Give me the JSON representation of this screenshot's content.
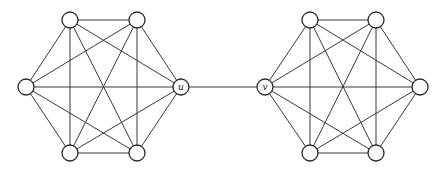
{
  "diagram": {
    "type": "graph",
    "node_radius": 8,
    "nodes": [
      {
        "id": "a1",
        "label": "",
        "x": 70,
        "y": 20
      },
      {
        "id": "a2",
        "label": "",
        "x": 137,
        "y": 20
      },
      {
        "id": "a3",
        "label": "",
        "x": 26,
        "y": 87
      },
      {
        "id": "u",
        "label": "u",
        "x": 181,
        "y": 87
      },
      {
        "id": "a5",
        "label": "",
        "x": 70,
        "y": 153
      },
      {
        "id": "a6",
        "label": "",
        "x": 137,
        "y": 153
      },
      {
        "id": "b1",
        "label": "",
        "x": 310,
        "y": 20
      },
      {
        "id": "b2",
        "label": "",
        "x": 376,
        "y": 20
      },
      {
        "id": "v",
        "label": "v",
        "x": 265,
        "y": 87
      },
      {
        "id": "b4",
        "label": "",
        "x": 420,
        "y": 87
      },
      {
        "id": "b5",
        "label": "",
        "x": 310,
        "y": 153
      },
      {
        "id": "b6",
        "label": "",
        "x": 376,
        "y": 153
      }
    ],
    "clusters": [
      {
        "name": "left-K6",
        "nodes": [
          "a1",
          "a2",
          "a3",
          "u",
          "a5",
          "a6"
        ]
      },
      {
        "name": "right-K6",
        "nodes": [
          "b1",
          "b2",
          "v",
          "b4",
          "b5",
          "b6"
        ]
      }
    ],
    "bridge": [
      "u",
      "v"
    ],
    "colors": {
      "stroke": "#2a2a2a",
      "fill": "#ffffff",
      "background": "#ffffff"
    }
  }
}
